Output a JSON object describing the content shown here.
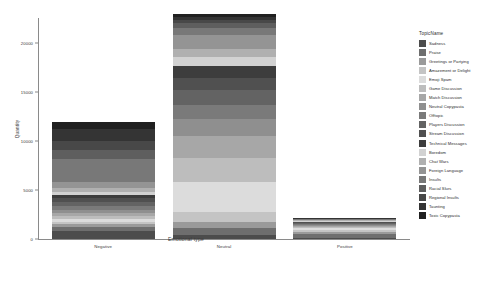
{
  "chart_data": {
    "type": "bar",
    "subtype": "stacked-bar",
    "title": "",
    "xlabel": "Emotional type",
    "ylabel": "Quantity",
    "categories": [
      "Negative",
      "Neutral",
      "Positive"
    ],
    "ylim": [
      0,
      22500
    ],
    "yticks": [
      0,
      5000,
      10000,
      15000,
      20000
    ],
    "ytick_labels": [
      "0",
      "5000",
      "10000",
      "15000",
      "20000"
    ],
    "grid": false,
    "legend_title": "TopicName",
    "legend_position": "right",
    "series": [
      {
        "name": "Sadness",
        "color": "#4c4c4c",
        "values": [
          780,
          420,
          95
        ]
      },
      {
        "name": "Praise",
        "color": "#6e6e6e",
        "values": [
          420,
          700,
          430
        ]
      },
      {
        "name": "Greetings or Partying",
        "color": "#9a9a9a",
        "values": [
          300,
          640,
          230
        ]
      },
      {
        "name": "Amazement or Delight",
        "color": "#c4c4c4",
        "values": [
          260,
          980,
          190
        ]
      },
      {
        "name": "Emoji Spam",
        "color": "#dcdcdc",
        "values": [
          240,
          3100,
          150
        ]
      },
      {
        "name": "Game Discussion",
        "color": "#bdbdbd",
        "values": [
          330,
          2450,
          120
        ]
      },
      {
        "name": "Match Discussion",
        "color": "#a7a7a7",
        "values": [
          360,
          2150,
          110
        ]
      },
      {
        "name": "Neutral Copypasta",
        "color": "#8f8f8f",
        "values": [
          300,
          1750,
          100
        ]
      },
      {
        "name": "Offtopic",
        "color": "#7a7a7a",
        "values": [
          350,
          1500,
          95
        ]
      },
      {
        "name": "Players Discussion",
        "color": "#636363",
        "values": [
          420,
          1450,
          90
        ]
      },
      {
        "name": "Stream Discussion",
        "color": "#505050",
        "values": [
          380,
          1300,
          85
        ]
      },
      {
        "name": "Technical Messages",
        "color": "#3d3d3d",
        "values": [
          330,
          1150,
          80
        ]
      },
      {
        "name": "Boredom",
        "color": "#d2d2d2",
        "values": [
          300,
          900,
          70
        ]
      },
      {
        "name": "Chat Wars",
        "color": "#b0b0b0",
        "values": [
          480,
          820,
          65
        ]
      },
      {
        "name": "Foreign Language",
        "color": "#949494",
        "values": [
          520,
          1450,
          60
        ]
      },
      {
        "name": "Insults",
        "color": "#787878",
        "values": [
          2350,
          780,
          55
        ]
      },
      {
        "name": "Racial Slurs",
        "color": "#5e5e5e",
        "values": [
          980,
          420,
          40
        ]
      },
      {
        "name": "Regional Insults",
        "color": "#484848",
        "values": [
          860,
          360,
          35
        ]
      },
      {
        "name": "Taunting",
        "color": "#343434",
        "values": [
          1250,
          330,
          30
        ]
      },
      {
        "name": "Toxic Copypasta",
        "color": "#202020",
        "values": [
          740,
          280,
          25
        ]
      }
    ],
    "totals": [
      11950,
      22930,
      2155
    ]
  }
}
